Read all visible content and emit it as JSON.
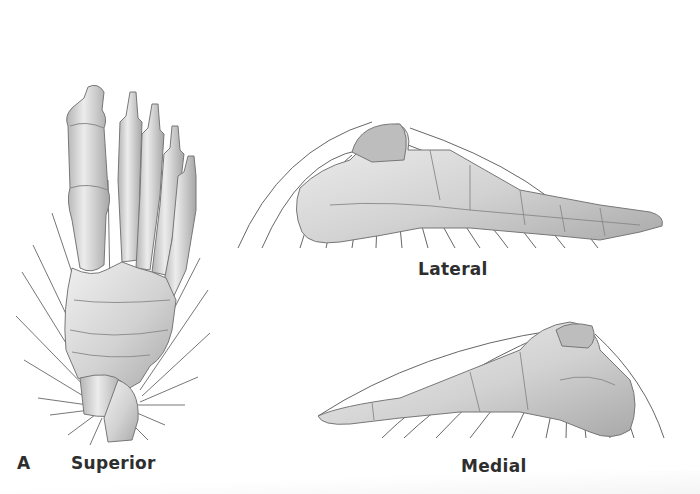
{
  "figure": {
    "panel_letter": "A",
    "views": [
      {
        "id": "superior",
        "label": "Superior"
      },
      {
        "id": "lateral",
        "label": "Lateral"
      },
      {
        "id": "medial",
        "label": "Medial"
      }
    ]
  },
  "colors": {
    "background": "#ffffff",
    "bone_fill": "#dcdcdc",
    "bone_shadow": "#a8a8a8",
    "bone_outline": "#6e6e6e",
    "axis_lines": "#555555",
    "label_text": "#2e2e2e"
  }
}
